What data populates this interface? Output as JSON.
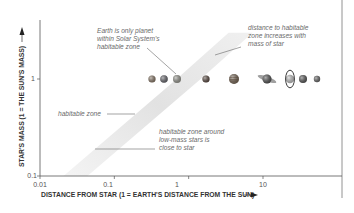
{
  "chart_data": {
    "type": "scatter",
    "title": "",
    "xlabel": "DISTANCE FROM STAR (1 = EARTH'S DISTANCE FROM THE SUN)",
    "ylabel": "STAR'S MASS (1 = THE SUN'S MASS)",
    "x_scale": "log",
    "y_scale": "log",
    "xlim": [
      0.01,
      50
    ],
    "ylim": [
      0.1,
      3
    ],
    "x_ticks": [
      "0.01",
      "0.1",
      "1",
      "10"
    ],
    "y_ticks": [
      "0.1",
      "1"
    ],
    "grid": false,
    "habitable_zone_band": {
      "label": "habitable zone",
      "points": [
        {
          "mass": 0.1,
          "distance": 0.03
        },
        {
          "mass": 1,
          "distance": 1
        },
        {
          "mass": 3,
          "distance": 5
        }
      ]
    },
    "planets": [
      {
        "name": "Mercury",
        "distance": 0.39,
        "mass_of_star": 1,
        "color": "#8a7a6a"
      },
      {
        "name": "Venus",
        "distance": 0.72,
        "mass_of_star": 1,
        "color": "#6a6a70"
      },
      {
        "name": "Earth",
        "distance": 1.0,
        "mass_of_star": 1,
        "color": "#9a9a92"
      },
      {
        "name": "Mars",
        "distance": 1.52,
        "mass_of_star": 1,
        "color": "#5a4a42"
      },
      {
        "name": "Jupiter",
        "distance": 5.2,
        "mass_of_star": 1,
        "color": "#7a6a5a"
      },
      {
        "name": "Saturn",
        "distance": 9.5,
        "mass_of_star": 1,
        "color": "#555555"
      },
      {
        "name": "Uranus",
        "distance": 19.2,
        "mass_of_star": 1,
        "color": "#c8c8c8"
      },
      {
        "name": "Neptune",
        "distance": 30,
        "mass_of_star": 1,
        "color": "#5a5a5a"
      },
      {
        "name": "Pluto",
        "distance": 39.5,
        "mass_of_star": 1,
        "color": "#6a6a6a"
      }
    ],
    "annotations": [
      {
        "id": "earth",
        "lines": [
          "Earth is only planet",
          "within Solar System's",
          "habitable zone"
        ]
      },
      {
        "id": "distance",
        "lines": [
          "distance to habitable",
          "zone increases with",
          "mass of star"
        ]
      },
      {
        "id": "hz",
        "lines": [
          "habitable zone"
        ]
      },
      {
        "id": "lowmass",
        "lines": [
          "habitable zone around",
          "low-mass stars is",
          "close to star"
        ]
      }
    ]
  },
  "colors": {
    "axis": "#555555",
    "band": "#e6e6e6",
    "text": "#6a6a6a",
    "label": "#333333"
  }
}
